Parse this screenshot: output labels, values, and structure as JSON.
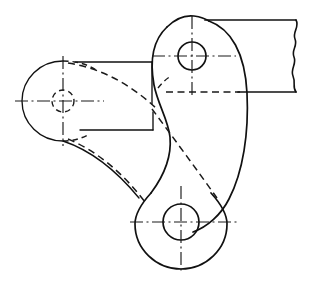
{
  "document": {
    "kind": "engineering-drawing",
    "title": "Bell Crank Lever — Orthographic View",
    "view": "front-view",
    "background_color": "#ffffff",
    "line_color": "#111111",
    "width": 321,
    "height": 282,
    "units": "px"
  },
  "line_styles": [
    {
      "name": "visible-edge",
      "label": "Visible outline",
      "pattern": "solid",
      "color": "#111111",
      "width": 1.7
    },
    {
      "name": "hidden-edge",
      "label": "Hidden edge",
      "pattern": "dashed",
      "color": "#1a1a1a",
      "width": 1.5
    },
    {
      "name": "center-line",
      "label": "Centre line",
      "pattern": "dash-dot",
      "color": "#1a1a1a",
      "width": 1.15
    },
    {
      "name": "break-line",
      "label": "Short break",
      "pattern": "wavy",
      "color": "#111111",
      "width": 1.6
    }
  ],
  "features": {
    "top_boss": {
      "label": "Upper pivot boss",
      "center": {
        "x": 192,
        "y": 56
      },
      "hole_radius": 14,
      "boss_radius": 41
    },
    "left_boss": {
      "label": "Left arm boss (hidden)",
      "center": {
        "x": 63,
        "y": 101
      },
      "hole_radius": 11,
      "boss_radius": 40
    },
    "bottom_boss": {
      "label": "Lower pivot boss",
      "center": {
        "x": 181,
        "y": 222
      },
      "hole_radius": 18,
      "boss_radius": 46
    },
    "bar": {
      "label": "Rectangular bar extension",
      "x_start": 212,
      "x_end": 297,
      "y_top": 20,
      "y_bottom": 92
    },
    "left_plate": {
      "label": "Left rectangular plate",
      "x_start": 63,
      "x_end": 152,
      "y_top": 62,
      "y_bottom": 130
    },
    "break": {
      "label": "Short break line",
      "x": 296,
      "y_top": 20,
      "y_bottom": 92
    }
  },
  "geometry": {
    "outer_right_contour": "M 209 21 C 232 28 246 52 248 92 C 250 130 244 170 230 198 C 222 214 208 226 192 231",
    "inner_s_contour": "M 168 26 C 153 40 151 62 155 84 C 159 104 168 118 170 136 C 172 158 164 176 152 192",
    "top_boss_arc": "M 168 26 C 176 19 186 15 194 16 C 202 17 207 19 209 21",
    "bottom_boss_arc_left": "M 152 192 C 142 203 136 214 136 223 C 136 248 156 268 181 268 C 186 268 190 267 192 266",
    "bottom_boss_arc_right": "M 192 231 C 205 238 226 246 226 223 C 226 214 222 203 212 192",
    "left_boss_outer_arc": "M 63 61 C 41 61 23 79 23 101 C 23 123 41 141 63 141",
    "left_boss_top_arc": "M 63 61 C 74 61 84 64 92 70",
    "left_boss_bottom_arc": "M 63 141 C 74 141 84 138 92 132",
    "left_upper_hidden_curve": "M 66 63 C 100 68 130 84 157 106",
    "left_lower_hidden_curve": "M 66 139 C 96 150 124 172 146 200",
    "left_lower_solid_curve": "M 63 141 C 93 152 122 174 146 202",
    "body_hidden_diagonal": "M 150 106 C 170 132 196 166 216 196",
    "bar_hidden_line_y": 92
  },
  "center_lines": {
    "top_boss_horizontal": {
      "x1": 152,
      "x2": 236,
      "y": 56
    },
    "top_boss_vertical": {
      "x": 192,
      "y1": 16,
      "y2": 98
    },
    "left_boss_horizontal": {
      "x1": 15,
      "x2": 104,
      "y": 101
    },
    "left_boss_vertical": {
      "x": 63,
      "y1": 56,
      "y2": 146
    },
    "bottom_boss_horizontal": {
      "x1": 130,
      "x2": 238,
      "y": 222
    },
    "bottom_boss_vertical": {
      "x": 181,
      "y1": 186,
      "y2": 273
    }
  },
  "annotations": {
    "dimension_text": "",
    "note_text": "",
    "title_block": ""
  }
}
